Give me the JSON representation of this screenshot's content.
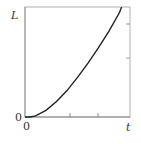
{
  "chart_data": {
    "type": "line",
    "title": "",
    "xlabel": "t",
    "ylabel": "L",
    "x_origin_label": "0",
    "y_origin_label": "0",
    "grid": false,
    "legend": null,
    "x_ticks_count": 2,
    "y_ticks_count_right": 2,
    "series": [
      {
        "name": "L(t)",
        "description": "convex increasing curve, approx quadratic, flat near t=0",
        "x": [
          0,
          0.05,
          0.1,
          0.2,
          0.3,
          0.4,
          0.5,
          0.6,
          0.7,
          0.8,
          0.9,
          0.92
        ],
        "y": [
          0,
          0.0,
          0.01,
          0.06,
          0.14,
          0.24,
          0.36,
          0.49,
          0.63,
          0.78,
          0.95,
          1.0
        ]
      }
    ],
    "xlim": [
      0,
      1
    ],
    "ylim": [
      0,
      1
    ]
  },
  "colors": {
    "axis": "#aaaaaa",
    "curve": "#222222",
    "text": "#333333"
  }
}
